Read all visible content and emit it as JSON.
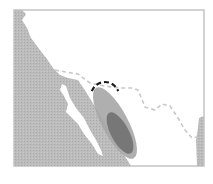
{
  "map": {
    "colors": {
      "background": "#ffffff",
      "land_gray": "#b9b9b9",
      "frame": "#c4c4c4",
      "plume_light": "#a8a8a8",
      "plume_dark": "#7a7a7a",
      "border_dash": "#c8c8c8",
      "arc": "#1a1a1a"
    },
    "frame": {
      "x": 14,
      "y": 10,
      "width": 190,
      "height": 156
    },
    "west_land": "14,10 22,10 26,14 22,20 27,28 31,38 40,50 47,59 53,68 60,75 68,78 78,80 86,92 94,105 102,118 110,132 118,146 126,158 131,166 14,166",
    "gulf": "62,84 66,86 70,98 76,108 84,118 90,130 96,140 101,150 103,156 98,154 92,144 84,134 78,124 70,116 66,112 68,104 64,96 60,90",
    "east_land": "199,118 204,116 204,166 197,166 196,140 198,128",
    "plume_outer": {
      "cx": 115,
      "cy": 123,
      "rx": 13,
      "ry": 40,
      "rotate": -28
    },
    "plume_inner": {
      "cx": 120,
      "cy": 133,
      "rx": 9,
      "ry": 23,
      "rotate": -28
    },
    "border_line": "55,70 66,72 78,74 90,83 104,86 120,88 132,88 138,90 145,107 155,110 162,104 170,106 178,118 185,130 192,138 197,137",
    "arc": {
      "cx": 105,
      "cy": 96,
      "r": 14
    }
  }
}
